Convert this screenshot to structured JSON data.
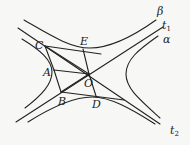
{
  "diagram": {
    "type": "hyperbola-geometry",
    "colors": {
      "stroke": "#222222",
      "background": "#f7f7f5"
    },
    "labels": {
      "beta": "β",
      "t1_main": "t",
      "t1_sub": "1",
      "alpha": "α",
      "t2_main": "t",
      "t2_sub": "2",
      "C": "C",
      "E": "E",
      "A": "A",
      "O": "O",
      "B": "B",
      "D": "D"
    },
    "points": {
      "C": [
        45,
        46
      ],
      "E": [
        83,
        49
      ],
      "A": [
        54,
        70
      ],
      "O": [
        89,
        74
      ],
      "B": [
        61,
        92
      ],
      "D": [
        96,
        96
      ]
    }
  }
}
